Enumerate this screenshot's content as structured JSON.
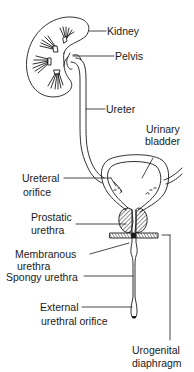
{
  "diagram": {
    "title": "",
    "labels": {
      "kidney": "Kidney",
      "pelvis": "Pelvis",
      "ureter": "Ureter",
      "urinary_bladder_line1": "Urinary",
      "urinary_bladder_line2": "bladder",
      "ureteral_orifice_line1": "Ureteral",
      "ureteral_orifice_line2": "orifice",
      "prostatic_urethra_line1": "Prostatic",
      "prostatic_urethra_line2": "urethra",
      "membranous_urethra_line1": "Membranous",
      "membranous_urethra_line2": "urethra",
      "spongy_urethra": "Spongy urethra",
      "external_urethral_orifice_line1": "External",
      "external_urethral_orifice_line2": "urethral orifice",
      "urogenital_diaphragm_line1": "Urogenital",
      "urogenital_diaphragm_line2": "diaphragm"
    },
    "colors": {
      "stroke": "#1a1a1a",
      "background": "#ffffff"
    }
  }
}
